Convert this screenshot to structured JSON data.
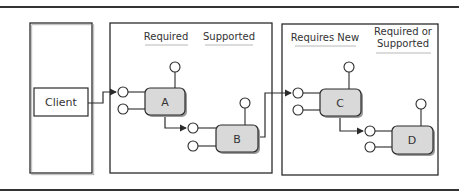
{
  "diagram": {
    "client": {
      "label": "Client"
    },
    "containers": [
      {
        "id": "middle",
        "columns": [
          {
            "label": "Required"
          },
          {
            "label": "Supported"
          }
        ]
      },
      {
        "id": "right",
        "columns": [
          {
            "label": "Requires New"
          },
          {
            "label_lines": [
              "Required or",
              "Supported"
            ]
          }
        ]
      }
    ],
    "nodes": [
      {
        "id": "A",
        "label": "A"
      },
      {
        "id": "B",
        "label": "B"
      },
      {
        "id": "C",
        "label": "C"
      },
      {
        "id": "D",
        "label": "D"
      }
    ],
    "edges": [
      {
        "from": "Client",
        "to": "A"
      },
      {
        "from": "A",
        "to": "B"
      },
      {
        "from": "B",
        "to": "C"
      },
      {
        "from": "C",
        "to": "D"
      }
    ],
    "colors": {
      "line": "#2b2b2b",
      "node_fill": "#d9d9d9",
      "node_shadow": "#9a9a9a",
      "underline": "#b8b8b8"
    }
  }
}
